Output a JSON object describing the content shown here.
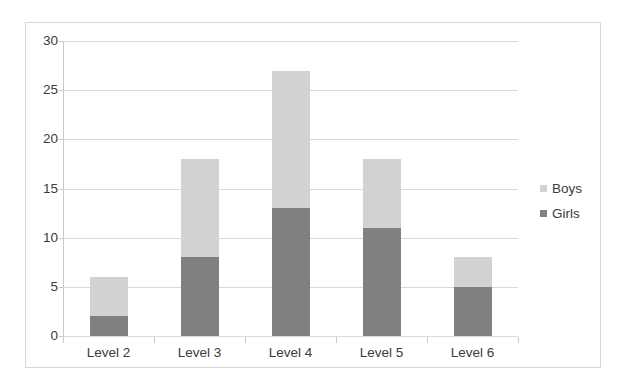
{
  "chart_data": {
    "type": "bar",
    "subtype": "stacked-vertical-bar",
    "title": "",
    "xlabel": "",
    "ylabel": "",
    "categories": [
      "Level 2",
      "Level 3",
      "Level 4",
      "Level 5",
      "Level 6"
    ],
    "series": [
      {
        "name": "Girls",
        "color": "#808080",
        "values": [
          2,
          8,
          13,
          11,
          5
        ]
      },
      {
        "name": "Boys",
        "color": "#d2d2d2",
        "values": [
          4,
          10,
          14,
          7,
          3
        ]
      }
    ],
    "stack_totals": [
      6,
      18,
      27,
      18,
      8
    ],
    "ylim": [
      0,
      30
    ],
    "y_ticks": [
      0,
      5,
      10,
      15,
      20,
      25,
      30
    ],
    "y_tick_labels": [
      "0",
      "5",
      "10",
      "15",
      "20",
      "25",
      "30"
    ],
    "grid": true,
    "grid_axis": "y",
    "grid_color": "#d9d9d9",
    "legend_position": "right",
    "legend_entries": [
      {
        "label": "Boys",
        "color": "#d2d2d2"
      },
      {
        "label": "Girls",
        "color": "#808080"
      }
    ],
    "plot_background": "#ffffff",
    "frame_border_color": "#d7d7d7"
  }
}
